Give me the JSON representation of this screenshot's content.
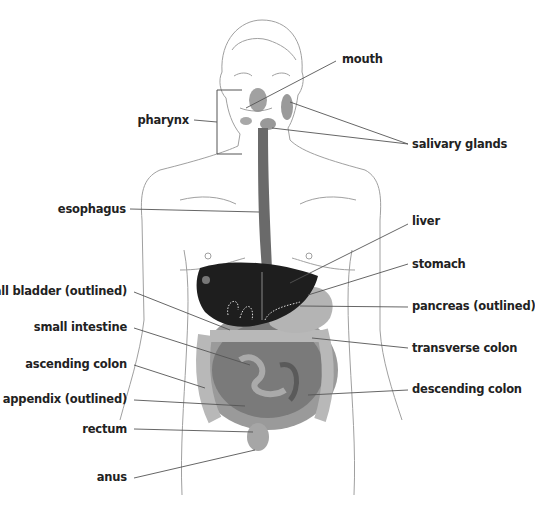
{
  "diagram": {
    "colors": {
      "outline": "#9a9a9a",
      "leader": "#555555",
      "liver": "#1e1e1e",
      "organ_mid": "#8a8a8a",
      "organ_light": "#c4c4c4",
      "text": "#222222"
    },
    "labels_left": [
      {
        "id": "pharynx",
        "text": "pharynx"
      },
      {
        "id": "esophagus",
        "text": "esophagus"
      },
      {
        "id": "gall_bladder",
        "text": "gall bladder (outlined)"
      },
      {
        "id": "small_intestine",
        "text": "small intestine"
      },
      {
        "id": "ascending_colon",
        "text": "ascending colon"
      },
      {
        "id": "appendix",
        "text": "appendix (outlined)"
      },
      {
        "id": "rectum",
        "text": "rectum"
      },
      {
        "id": "anus",
        "text": "anus"
      }
    ],
    "labels_right": [
      {
        "id": "mouth",
        "text": "mouth"
      },
      {
        "id": "salivary_glands",
        "text": "salivary glands"
      },
      {
        "id": "liver",
        "text": "liver"
      },
      {
        "id": "stomach",
        "text": "stomach"
      },
      {
        "id": "pancreas",
        "text": "pancreas (outlined)"
      },
      {
        "id": "transverse_colon",
        "text": "transverse colon"
      },
      {
        "id": "descending_colon",
        "text": "descending colon"
      }
    ]
  }
}
